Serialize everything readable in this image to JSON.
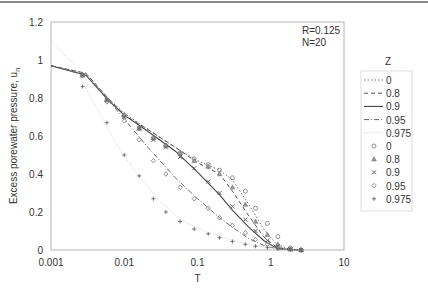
{
  "chart_data": {
    "type": "line",
    "title": "",
    "xlabel": "T",
    "ylabel": "Excess porewater pressure, u",
    "ylabel_subscript": "n",
    "xscale": "log",
    "xlim": [
      0.001,
      10
    ],
    "ylim": [
      0,
      1.2
    ],
    "xticks": [
      "0.001",
      "0.01",
      "0.1",
      "1",
      "10"
    ],
    "yticks": [
      "0",
      "0.2",
      "0.4",
      "0.6",
      "0.8",
      "1",
      "1.2"
    ],
    "grid": false,
    "annotations": [
      "R=0.125",
      "N=20"
    ],
    "legend": {
      "title": "Z",
      "position": "right",
      "entries": [
        {
          "label": "0",
          "kind": "line",
          "style": "dotted"
        },
        {
          "label": "0.8",
          "kind": "line",
          "style": "dashed"
        },
        {
          "label": "0.9",
          "kind": "line",
          "style": "solid"
        },
        {
          "label": "0.95",
          "kind": "line",
          "style": "dashdot"
        },
        {
          "label": "0.975",
          "kind": "line",
          "style": "faint"
        },
        {
          "label": "0",
          "kind": "marker",
          "marker": "circle"
        },
        {
          "label": "0.8",
          "kind": "marker",
          "marker": "triangle"
        },
        {
          "label": "0.9",
          "kind": "marker",
          "marker": "x"
        },
        {
          "label": "0.95",
          "kind": "marker",
          "marker": "diamond"
        },
        {
          "label": "0.975",
          "kind": "marker",
          "marker": "plus"
        }
      ]
    },
    "lines": [
      {
        "name": "Z=0 (analytical)",
        "style": "dotted",
        "x": [
          0.001,
          0.003,
          0.006,
          0.01,
          0.02,
          0.05,
          0.1,
          0.2,
          0.3,
          0.5,
          0.8,
          1.2,
          1.8,
          2.6
        ],
        "y": [
          0.97,
          0.93,
          0.8,
          0.72,
          0.64,
          0.54,
          0.47,
          0.42,
          0.37,
          0.24,
          0.11,
          0.03,
          0.005,
          0.0
        ]
      },
      {
        "name": "Z=0.8 (analytical)",
        "style": "dashed",
        "x": [
          0.001,
          0.003,
          0.006,
          0.01,
          0.02,
          0.05,
          0.1,
          0.2,
          0.3,
          0.5,
          0.8,
          1.2,
          1.8,
          2.6
        ],
        "y": [
          0.97,
          0.93,
          0.8,
          0.71,
          0.64,
          0.54,
          0.46,
          0.4,
          0.31,
          0.18,
          0.07,
          0.015,
          0.003,
          0.0
        ]
      },
      {
        "name": "Z=0.9 (analytical)",
        "style": "solid",
        "x": [
          0.001,
          0.003,
          0.006,
          0.01,
          0.02,
          0.05,
          0.1,
          0.2,
          0.3,
          0.5,
          0.8,
          1.2,
          1.8,
          2.6
        ],
        "y": [
          0.97,
          0.92,
          0.79,
          0.71,
          0.63,
          0.52,
          0.41,
          0.29,
          0.21,
          0.12,
          0.05,
          0.01,
          0.002,
          0.0
        ]
      },
      {
        "name": "Z=0.95 (analytical)",
        "style": "dashdot",
        "x": [
          0.001,
          0.003,
          0.006,
          0.01,
          0.02,
          0.05,
          0.1,
          0.2,
          0.3,
          0.5,
          0.8,
          1.2,
          1.8,
          2.6
        ],
        "y": [
          0.97,
          0.92,
          0.79,
          0.69,
          0.55,
          0.38,
          0.27,
          0.17,
          0.12,
          0.06,
          0.025,
          0.006,
          0.001,
          0.0
        ]
      },
      {
        "name": "Z=0.975 (analytical)",
        "style": "faint",
        "x": [
          0.001,
          0.002,
          0.004,
          0.008,
          0.015,
          0.03,
          0.06,
          0.12,
          0.25,
          0.5,
          1.0,
          1.8,
          2.6
        ],
        "y": [
          1.1,
          0.98,
          0.76,
          0.55,
          0.4,
          0.26,
          0.16,
          0.1,
          0.06,
          0.03,
          0.01,
          0.002,
          0.0
        ]
      }
    ],
    "series": [
      {
        "name": "Z=0",
        "marker": "circle",
        "x": [
          0.0027,
          0.0058,
          0.01,
          0.016,
          0.025,
          0.037,
          0.058,
          0.09,
          0.14,
          0.2,
          0.3,
          0.45,
          0.62,
          0.9,
          1.25,
          1.85,
          2.6
        ],
        "y": [
          0.92,
          0.79,
          0.71,
          0.64,
          0.59,
          0.55,
          0.51,
          0.48,
          0.45,
          0.42,
          0.38,
          0.31,
          0.22,
          0.14,
          0.07,
          0.01,
          0.0
        ]
      },
      {
        "name": "Z=0.8",
        "marker": "triangle",
        "x": [
          0.0027,
          0.0058,
          0.01,
          0.016,
          0.025,
          0.037,
          0.058,
          0.09,
          0.14,
          0.2,
          0.3,
          0.45,
          0.62,
          0.9,
          1.25,
          1.85,
          2.6
        ],
        "y": [
          0.92,
          0.79,
          0.71,
          0.64,
          0.59,
          0.55,
          0.51,
          0.47,
          0.44,
          0.4,
          0.33,
          0.24,
          0.15,
          0.08,
          0.03,
          0.005,
          0.0
        ]
      },
      {
        "name": "Z=0.9",
        "marker": "x",
        "x": [
          0.0027,
          0.0058,
          0.01,
          0.016,
          0.025,
          0.037,
          0.058,
          0.09,
          0.14,
          0.2,
          0.3,
          0.45,
          0.62,
          0.9,
          1.25,
          1.85,
          2.6
        ],
        "y": [
          0.92,
          0.79,
          0.7,
          0.64,
          0.58,
          0.54,
          0.49,
          0.43,
          0.36,
          0.3,
          0.23,
          0.16,
          0.1,
          0.05,
          0.02,
          0.004,
          0.0
        ]
      },
      {
        "name": "Z=0.95",
        "marker": "diamond",
        "x": [
          0.0027,
          0.0058,
          0.01,
          0.016,
          0.025,
          0.037,
          0.058,
          0.09,
          0.14,
          0.2,
          0.3,
          0.45,
          0.62,
          0.9,
          1.25,
          1.85,
          2.6
        ],
        "y": [
          0.92,
          0.78,
          0.68,
          0.58,
          0.47,
          0.4,
          0.33,
          0.27,
          0.22,
          0.17,
          0.13,
          0.09,
          0.055,
          0.03,
          0.012,
          0.003,
          0.0
        ]
      },
      {
        "name": "Z=0.975",
        "marker": "plus",
        "x": [
          0.0027,
          0.0058,
          0.01,
          0.016,
          0.025,
          0.037,
          0.058,
          0.09,
          0.14,
          0.2,
          0.3,
          0.45,
          0.62,
          0.9,
          1.25,
          1.85,
          2.6
        ],
        "y": [
          0.86,
          0.67,
          0.5,
          0.39,
          0.27,
          0.2,
          0.15,
          0.11,
          0.085,
          0.065,
          0.045,
          0.03,
          0.02,
          0.012,
          0.006,
          0.002,
          0.0
        ]
      }
    ]
  }
}
